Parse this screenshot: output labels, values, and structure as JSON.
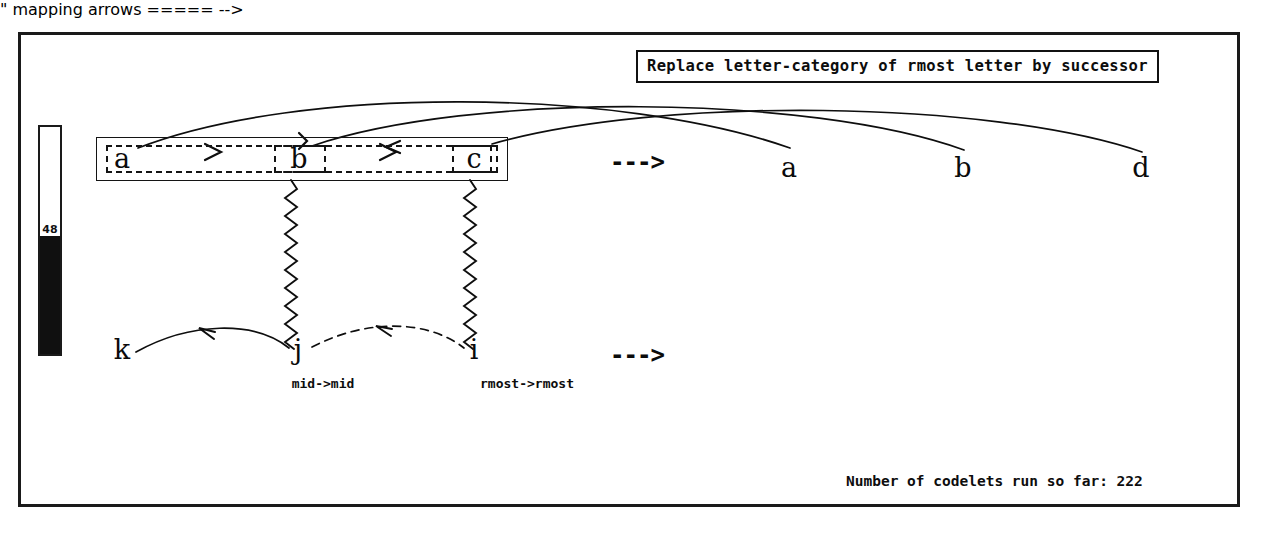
{
  "window": {
    "title": "Copycat Workspace"
  },
  "banner": {
    "text": "Replace letter-category of rmost letter by successor"
  },
  "temperature": {
    "value": "48",
    "percent": 48,
    "fill_color": "#101010",
    "frame_color": "#1a1a1a"
  },
  "status": {
    "codelet_counter": "Number of codelets run so far: 222"
  },
  "arrows": {
    "initial_to_modified": "--->",
    "target_to_answer": "--->"
  },
  "strings": {
    "initial": {
      "name": "initial-string",
      "letters": [
        {
          "label": "a",
          "x": 122,
          "y": 158
        },
        {
          "label": "b",
          "x": 299,
          "y": 158
        },
        {
          "label": "c",
          "x": 474,
          "y": 158
        }
      ]
    },
    "modified": {
      "name": "modified-string",
      "letters": [
        {
          "label": "a",
          "x": 789,
          "y": 167
        },
        {
          "label": "b",
          "x": 963,
          "y": 167
        },
        {
          "label": "d",
          "x": 1141,
          "y": 167
        }
      ]
    },
    "target": {
      "name": "target-string",
      "letters": [
        {
          "label": "k",
          "x": 122,
          "y": 349
        },
        {
          "label": "j",
          "x": 298,
          "y": 349
        },
        {
          "label": "i",
          "x": 474,
          "y": 349
        }
      ]
    }
  },
  "groups": {
    "whole_string_box": {
      "x": 96,
      "y": 137,
      "w": 412,
      "h": 44
    },
    "inner_dashed_box": {
      "x": 106,
      "y": 145,
      "w": 386,
      "h": 28
    },
    "letter_b_box": {
      "x": 274,
      "y": 145,
      "w": 52,
      "h": 28
    },
    "letter_c_box": {
      "x": 452,
      "y": 145,
      "w": 46,
      "h": 28
    }
  },
  "mappings": [
    {
      "label": "mid->mid",
      "x": 323,
      "y": 377
    },
    {
      "label": "rmost->rmost",
      "x": 527,
      "y": 377
    }
  ],
  "correspondences": [
    {
      "from": "a",
      "to": "a",
      "style": "solid-arc"
    },
    {
      "from": "b",
      "to": "b",
      "style": "solid-arc"
    },
    {
      "from": "c",
      "to": "d",
      "style": "solid-arc"
    }
  ],
  "vertical_links": [
    {
      "from": "b",
      "to": "j",
      "style": "zigzag"
    },
    {
      "from": "c",
      "to": "i",
      "style": "zigzag"
    }
  ],
  "bonds": [
    {
      "from": "k",
      "to": "j",
      "style": "solid-predecessor-arc"
    },
    {
      "from": "j",
      "to": "i",
      "style": "dashed-predecessor-arc"
    },
    {
      "from": "a",
      "to": "b",
      "style": "dashed-successor"
    },
    {
      "from": "b",
      "to": "c",
      "style": "dashed-successor"
    }
  ]
}
